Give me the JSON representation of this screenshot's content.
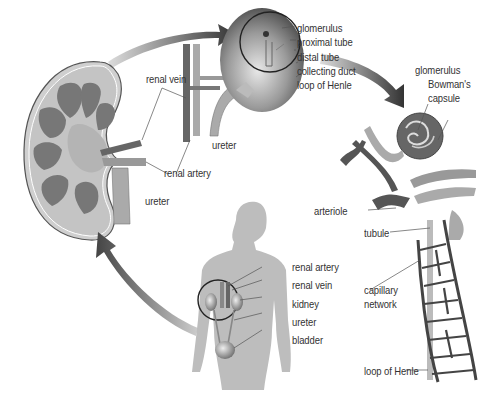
{
  "diagram": {
    "title": "",
    "type": "anatomical illustration of the human kidney and nephron",
    "panels": [
      {
        "id": "kidney-section",
        "description": "longitudinal section of kidney"
      },
      {
        "id": "kidney-closeup",
        "description": "kidney with nephron highlighted in circle"
      },
      {
        "id": "nephron",
        "description": "nephron with glomerulus, capillaries and loop of Henle"
      },
      {
        "id": "body",
        "description": "human torso showing urinary system"
      }
    ]
  },
  "labels": {
    "kidney_section": {
      "renal_vein": "renal vein",
      "renal_artery": "renal artery",
      "ureter_left": "ureter",
      "ureter_mid": "ureter"
    },
    "kidney_closeup": {
      "glomerulus": "glomerulus",
      "proximal_tube": "proximal tube",
      "distal_tube": "distal tube",
      "collecting_duct": "collecting duct",
      "loop_of_henle": "loop of Henle"
    },
    "nephron": {
      "glomerulus": "glomerulus",
      "bowmans_capsule_1": "Bowman's",
      "bowmans_capsule_2": "capsule",
      "arteriole": "arteriole",
      "tubule": "tubule",
      "capillary_network_1": "capillary",
      "capillary_network_2": "network",
      "loop_of_henle": "loop of Henle"
    },
    "body": {
      "renal_artery": "renal artery",
      "renal_vein": "renal vein",
      "kidney": "kidney",
      "ureter": "ureter",
      "bladder": "bladder"
    }
  },
  "colors": {
    "dark": "#4a4a4a",
    "mid": "#8c8c8c",
    "light": "#b8b8b8",
    "pale": "#d6d6d6",
    "arrow": "#3a3a3a",
    "text": "#333333"
  }
}
